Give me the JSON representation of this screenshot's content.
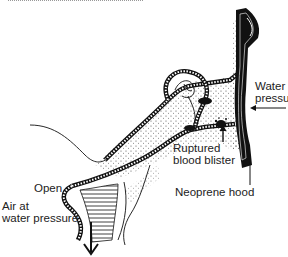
{
  "figure": {
    "labels": {
      "water_pressure": [
        "Water",
        "pressure"
      ],
      "ruptured_blood_blister": [
        "Ruptured",
        "blood blister"
      ],
      "neoprene_hood": "Neoprene hood",
      "open": "Open",
      "air_at_water_pressure": [
        "Air at",
        "water pressure"
      ]
    },
    "icons": {
      "water_pressure_arrow": "arrow-left",
      "blister_arrow": "arrow-up",
      "eustachian_flow_arrow": "arrow-down"
    },
    "colors": {
      "ink": "#111111",
      "background": "#ffffff",
      "label_text": "#222222"
    }
  }
}
